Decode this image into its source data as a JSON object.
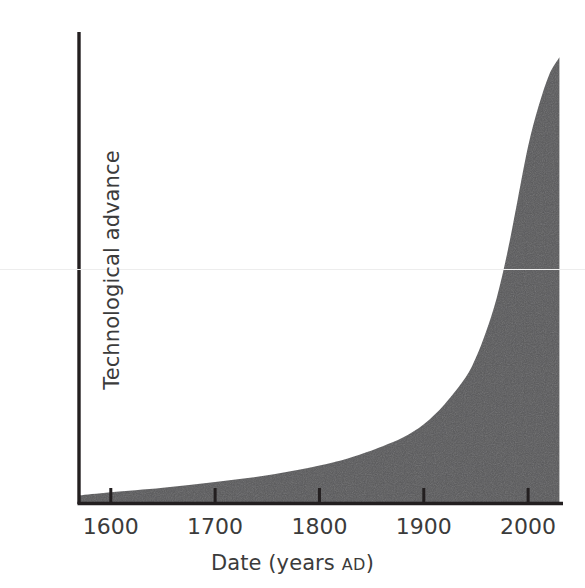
{
  "figure": {
    "background_color": "#ffffff",
    "artifact_line_color": "#ededed"
  },
  "chart_data": {
    "type": "area",
    "title": "",
    "subtitle": "",
    "xlabel_text": "Date (years ",
    "xlabel_smallcaps": "AD",
    "xlabel_tail": ")",
    "xlabel": "Date (years AD)",
    "ylabel": "Technological advance",
    "x": [
      1570,
      1600,
      1650,
      1700,
      1750,
      1800,
      1830,
      1860,
      1880,
      1900,
      1920,
      1940,
      1950,
      1960,
      1970,
      1980,
      1990,
      2000,
      2010,
      2020,
      2030
    ],
    "values": [
      1.5,
      2.2,
      3.2,
      4.5,
      6.0,
      8.2,
      10.0,
      12.5,
      14.5,
      17.5,
      22.0,
      28.0,
      32.5,
      38.5,
      46.0,
      56.0,
      68.0,
      80.0,
      89.0,
      96.0,
      100.0
    ],
    "series": [
      {
        "name": "Technological advance",
        "values": [
          1.5,
          2.2,
          3.2,
          4.5,
          6.0,
          8.2,
          10.0,
          12.5,
          14.5,
          17.5,
          22.0,
          28.0,
          32.5,
          38.5,
          46.0,
          56.0,
          68.0,
          80.0,
          89.0,
          96.0,
          100.0
        ]
      }
    ],
    "fill_color": "#58585a",
    "line_color": "#58585a",
    "axis_color": "#231f20",
    "xlim": [
      1570,
      2032
    ],
    "ylim": [
      0,
      103
    ],
    "xticks": [
      1600,
      1700,
      1800,
      1900,
      2000
    ],
    "xtick_labels": [
      "1600",
      "1700",
      "1800",
      "1900",
      "2000"
    ],
    "yticks": [],
    "ytick_labels": [],
    "grid": false,
    "legend": null,
    "legend_position": "none",
    "annotations": []
  }
}
